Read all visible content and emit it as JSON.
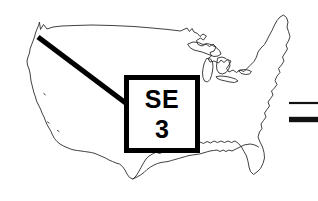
{
  "figure": {
    "background_color": "#ffffff",
    "ink_color": "#000000",
    "map_stroke_color": "#2b2b2b"
  },
  "map": {
    "region_name": "Continental United States",
    "outline_style": "thin black line drawing",
    "features": [
      "west-coast-outline",
      "northern-border",
      "great-lakes",
      "east-coast-outline",
      "gulf-coast",
      "florida-peninsula"
    ]
  },
  "callout": {
    "code": "SE",
    "number": "3",
    "border_color": "#000000",
    "fill_color": "#ffffff"
  },
  "leader": {
    "label": "leader line from Pacific Northwest to callout box",
    "origin_x": 38,
    "origin_y": 37,
    "target_x": 126,
    "target_y": 103,
    "color": "#000000"
  },
  "legend": {
    "items": [
      {
        "name": "thin-rule",
        "weight": "thin",
        "color": "#111111"
      },
      {
        "name": "thick-rule",
        "weight": "thick",
        "color": "#111111"
      }
    ]
  }
}
